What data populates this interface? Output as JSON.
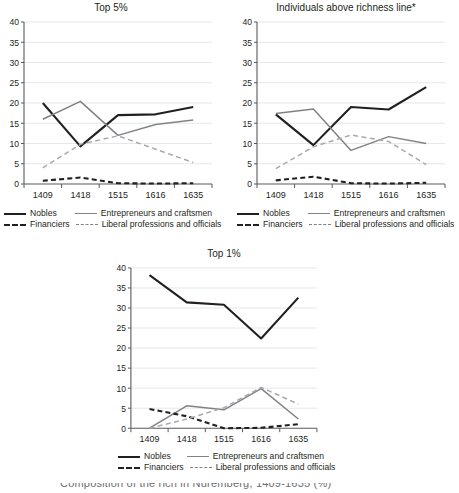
{
  "figure": {
    "caption_cut": "Composition of the rich in Nuremberg, 1409-1635 (%)"
  },
  "legend": {
    "items": [
      {
        "label": "Nobles",
        "key": "solid-dark"
      },
      {
        "label": "Entrepreneurs and craftsmen",
        "key": "solid-gray"
      },
      {
        "label": "Financiers",
        "key": "dash-dark"
      },
      {
        "label": "Liberal professions and officials",
        "key": "dash-gray"
      }
    ]
  },
  "colors": {
    "nobles": "#231f20",
    "entrepreneurs": "#808285",
    "financiers": "#231f20",
    "liberal": "#a7a9ac",
    "grid": "#e6e7e8",
    "axis": "#58595b",
    "text": "#231f20"
  },
  "axis": {
    "yticks": [
      "0",
      "5",
      "10",
      "15",
      "20",
      "25",
      "30",
      "35",
      "40"
    ],
    "xticks": [
      "1409",
      "1418",
      "1515",
      "1616",
      "1635"
    ]
  },
  "chart_data": [
    {
      "type": "line",
      "title": "Top 5%",
      "xlabel": "",
      "ylabel": "",
      "x": [
        "1409",
        "1418",
        "1515",
        "1616",
        "1635"
      ],
      "ylim": [
        0,
        40
      ],
      "ytick_step": 5,
      "grid": true,
      "legend_position": "bottom",
      "series": [
        {
          "name": "Nobles",
          "values": [
            20.0,
            9.3,
            17.0,
            17.2,
            19.0
          ],
          "style": "solid",
          "color": "#231f20"
        },
        {
          "name": "Entrepreneurs and craftsmen",
          "values": [
            16.0,
            20.4,
            12.0,
            14.7,
            15.8
          ],
          "style": "solid",
          "color": "#808285"
        },
        {
          "name": "Financiers",
          "values": [
            0.8,
            1.6,
            0.2,
            0.1,
            0.2
          ],
          "style": "dashed",
          "color": "#231f20"
        },
        {
          "name": "Liberal professions and officials",
          "values": [
            4.0,
            9.8,
            11.9,
            8.6,
            5.3
          ],
          "style": "dashed",
          "color": "#a7a9ac"
        }
      ]
    },
    {
      "type": "line",
      "title": "Individuals above richness line*",
      "xlabel": "",
      "ylabel": "",
      "x": [
        "1409",
        "1418",
        "1515",
        "1616",
        "1635"
      ],
      "ylim": [
        0,
        40
      ],
      "ytick_step": 5,
      "grid": true,
      "legend_position": "bottom",
      "series": [
        {
          "name": "Nobles",
          "values": [
            17.2,
            9.6,
            19.0,
            18.4,
            23.9
          ],
          "style": "solid",
          "color": "#231f20"
        },
        {
          "name": "Entrepreneurs and craftsmen",
          "values": [
            17.4,
            18.5,
            8.3,
            11.7,
            10.0
          ],
          "style": "solid",
          "color": "#808285"
        },
        {
          "name": "Financiers",
          "values": [
            0.9,
            1.8,
            0.2,
            0.1,
            0.3
          ],
          "style": "dashed",
          "color": "#231f20"
        },
        {
          "name": "Liberal professions and officials",
          "values": [
            3.8,
            9.2,
            12.1,
            10.5,
            4.8
          ],
          "style": "dashed",
          "color": "#a7a9ac"
        }
      ]
    },
    {
      "type": "line",
      "title": "Top 1%",
      "xlabel": "",
      "ylabel": "",
      "x": [
        "1409",
        "1418",
        "1515",
        "1616",
        "1635"
      ],
      "ylim": [
        0,
        40
      ],
      "ytick_step": 5,
      "grid": true,
      "legend_position": "bottom",
      "series": [
        {
          "name": "Nobles",
          "values": [
            38.2,
            31.4,
            30.8,
            22.4,
            32.6
          ],
          "style": "solid",
          "color": "#231f20"
        },
        {
          "name": "Entrepreneurs and craftsmen",
          "values": [
            0.0,
            5.6,
            4.6,
            9.9,
            2.3
          ],
          "style": "solid",
          "color": "#808285"
        },
        {
          "name": "Financiers",
          "values": [
            4.8,
            3.0,
            0.0,
            0.1,
            1.0
          ],
          "style": "dashed",
          "color": "#231f20"
        },
        {
          "name": "Liberal professions and officials",
          "values": [
            0.0,
            2.3,
            5.1,
            10.2,
            6.0
          ],
          "style": "dashed",
          "color": "#a7a9ac"
        }
      ]
    }
  ]
}
